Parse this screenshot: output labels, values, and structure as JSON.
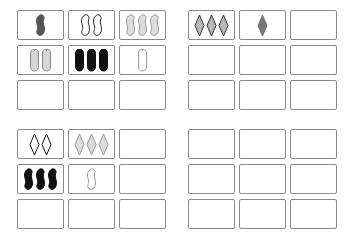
{
  "game": "set-card-board",
  "groups": [
    {
      "name": "group-top-left",
      "cards": [
        {
          "count": 1,
          "shape": "squiggle",
          "fill": "solid",
          "color": "#555555"
        },
        {
          "count": 2,
          "shape": "squiggle",
          "fill": "outline",
          "color": "#222222"
        },
        {
          "count": 3,
          "shape": "squiggle",
          "fill": "striped",
          "color": "#999999"
        },
        {
          "count": 2,
          "shape": "oval",
          "fill": "striped",
          "color": "#888888"
        },
        {
          "count": 3,
          "shape": "oval",
          "fill": "solid",
          "color": "#111111"
        },
        {
          "count": 1,
          "shape": "oval",
          "fill": "outline",
          "color": "#999999"
        },
        null,
        null,
        null
      ]
    },
    {
      "name": "group-top-right",
      "cards": [
        {
          "count": 3,
          "shape": "diamond",
          "fill": "striped",
          "color": "#333333"
        },
        {
          "count": 1,
          "shape": "diamond",
          "fill": "solid",
          "color": "#777777"
        },
        null,
        null,
        null,
        null,
        null,
        null,
        null
      ]
    },
    {
      "name": "group-bottom-left",
      "cards": [
        {
          "count": 2,
          "shape": "diamond",
          "fill": "outline",
          "color": "#111111"
        },
        {
          "count": 3,
          "shape": "diamond",
          "fill": "striped",
          "color": "#999999"
        },
        null,
        {
          "count": 3,
          "shape": "squiggle",
          "fill": "solid",
          "color": "#111111"
        },
        {
          "count": 1,
          "shape": "squiggle",
          "fill": "outline",
          "color": "#999999"
        },
        null,
        null,
        null,
        null
      ]
    },
    {
      "name": "group-bottom-right",
      "cards": [
        null,
        null,
        null,
        null,
        null,
        null,
        null,
        null,
        null
      ]
    }
  ]
}
